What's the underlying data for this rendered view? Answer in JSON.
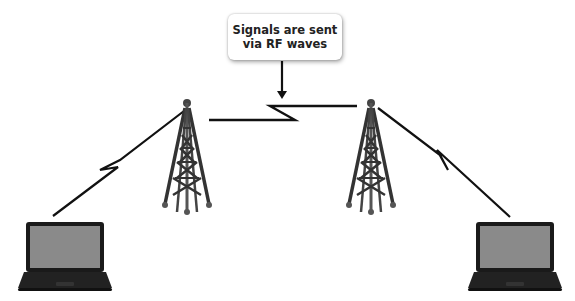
{
  "callout": {
    "line1": "Signals are sent",
    "line2": "via RF waves"
  },
  "nodes": [
    {
      "id": "laptop-left",
      "type": "laptop"
    },
    {
      "id": "tower-left",
      "type": "radio-tower"
    },
    {
      "id": "tower-right",
      "type": "radio-tower"
    },
    {
      "id": "laptop-right",
      "type": "laptop"
    }
  ],
  "links": [
    {
      "from": "laptop-left",
      "to": "tower-left",
      "style": "rf-zigzag"
    },
    {
      "from": "tower-left",
      "to": "tower-right",
      "style": "rf-zigzag"
    },
    {
      "from": "tower-right",
      "to": "laptop-right",
      "style": "rf-zigzag"
    }
  ],
  "colors": {
    "line": "#111111",
    "laptop_body": "#1a1a1a",
    "laptop_screen": "#8a8a8a",
    "tower": "#3a3a3a"
  }
}
